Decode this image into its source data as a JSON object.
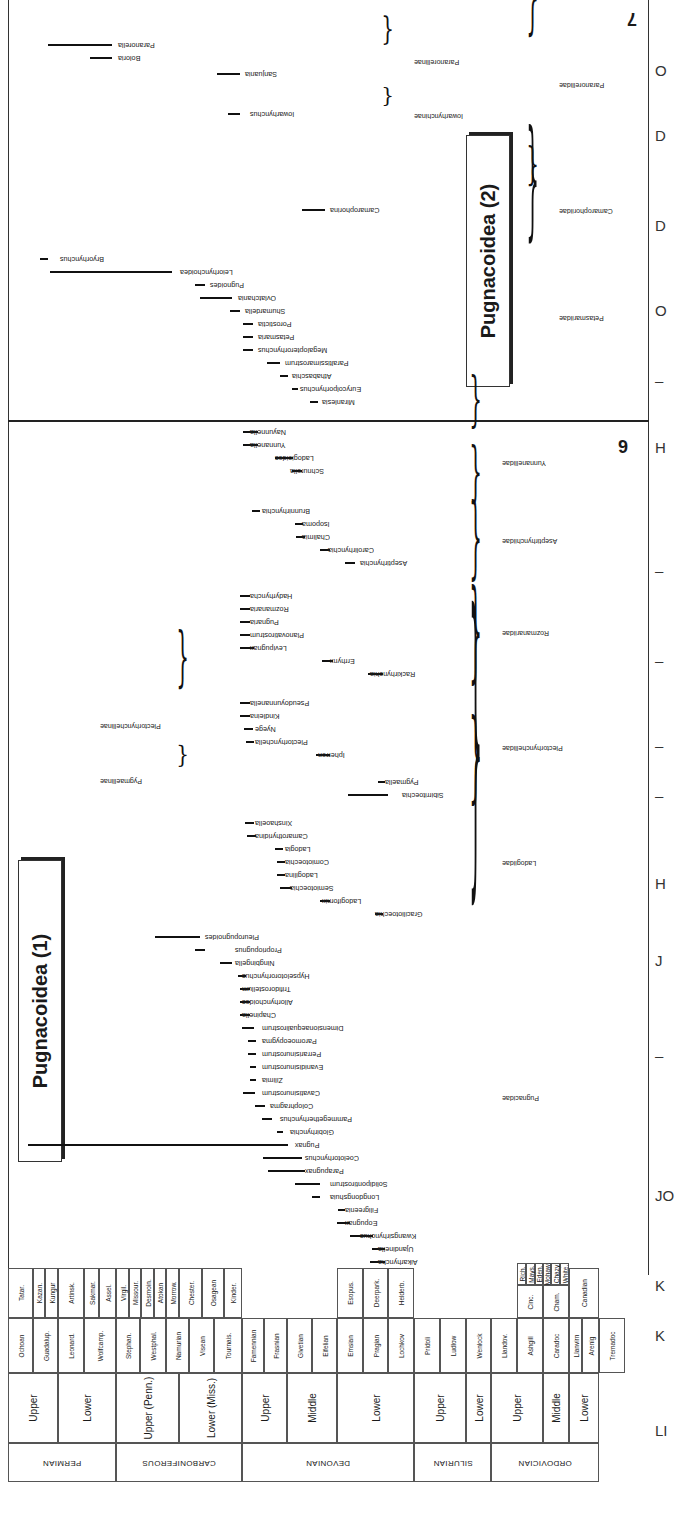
{
  "figure": {
    "orientation": "rotated-180",
    "page_numbers": {
      "left_panel": "6",
      "right_panel": "7"
    },
    "superfamily_boxes": [
      {
        "label": "Pugnacoidea (1)",
        "x": 18,
        "y": 860,
        "w": 42,
        "h": 300
      },
      {
        "label": "Pugnacoidea (2)",
        "x": 466,
        "y": 135,
        "w": 42,
        "h": 250
      }
    ],
    "right_margin_letters": [
      {
        "text": "O",
        "y": 70
      },
      {
        "text": "D",
        "y": 135
      },
      {
        "text": "D",
        "y": 225
      },
      {
        "text": "O",
        "y": 310
      },
      {
        "text": "–",
        "y": 380
      },
      {
        "text": "H",
        "y": 447
      },
      {
        "text": "–",
        "y": 570
      },
      {
        "text": "–",
        "y": 660
      },
      {
        "text": "–",
        "y": 745
      },
      {
        "text": "–",
        "y": 795
      },
      {
        "text": "H",
        "y": 883
      },
      {
        "text": "J",
        "y": 960
      },
      {
        "text": "–",
        "y": 1055
      },
      {
        "text": "JO",
        "y": 1195
      },
      {
        "text": "K",
        "y": 1285
      },
      {
        "text": "K",
        "y": 1335
      },
      {
        "text": "LI",
        "y": 1430
      }
    ]
  },
  "groups": [
    {
      "name": "Paranorellidae",
      "level": "family",
      "brace_x": 545,
      "y1": 45,
      "y2": 128
    },
    {
      "name": "Paranorellinae",
      "level": "subfamily",
      "brace_x": 400,
      "y1": 48,
      "y2": 80
    },
    {
      "name": "Iowarhynchinae",
      "level": "subfamily",
      "brace_x": 400,
      "y1": 108,
      "y2": 128
    },
    {
      "name": "Camarophoriidae",
      "level": "family",
      "brace_x": 545,
      "y1": 190,
      "y2": 235
    },
    {
      "name": "Petasmariidae",
      "level": "family",
      "brace_x": 545,
      "y1": 255,
      "y2": 385
    },
    {
      "name": "Yunnanellidae",
      "level": "family",
      "brace_x": 488,
      "y1": 435,
      "y2": 495
    },
    {
      "name": "Aseptirhynchiidae",
      "level": "family",
      "brace_x": 488,
      "y1": 510,
      "y2": 575
    },
    {
      "name": "Rozmanariidae",
      "level": "family",
      "brace_x": 488,
      "y1": 590,
      "y2": 680
    },
    {
      "name": "Plectorhynchellidae",
      "level": "family",
      "brace_x": 488,
      "y1": 695,
      "y2": 805
    },
    {
      "name": "Plectorhynchellinae",
      "level": "subfamily",
      "brace_x": 195,
      "y1": 695,
      "y2": 760
    },
    {
      "name": "Pygmaellinae",
      "level": "subfamily",
      "brace_x": 195,
      "y1": 770,
      "y2": 795
    },
    {
      "name": "Ladogiidae",
      "level": "family",
      "brace_x": 488,
      "y1": 815,
      "y2": 915
    },
    {
      "name": "Pugnacidae",
      "level": "family",
      "brace_x": 488,
      "y1": 935,
      "y2": 1265
    }
  ],
  "taxa": [
    {
      "name": "Paranorella",
      "label_x": 118,
      "y": 45,
      "bar_x1": 48,
      "bar_x2": 112
    },
    {
      "name": "Boloria",
      "label_x": 118,
      "y": 58,
      "bar_x1": 90,
      "bar_x2": 112
    },
    {
      "name": "Sanjuania",
      "label_x": 245,
      "y": 74,
      "bar_x1": 217,
      "bar_x2": 240
    },
    {
      "name": "Iowarhynchus",
      "label_x": 250,
      "y": 114,
      "bar_x1": 228,
      "bar_x2": 240
    },
    {
      "name": "Camarophorina",
      "label_x": 330,
      "y": 210,
      "bar_x1": 302,
      "bar_x2": 325
    },
    {
      "name": "Bryorhynchus",
      "label_x": 60,
      "y": 259,
      "bar_x1": 40,
      "bar_x2": 48
    },
    {
      "name": "Leiorhynchoidea",
      "label_x": 180,
      "y": 272,
      "bar_x1": 50,
      "bar_x2": 172
    },
    {
      "name": "Pugnoides",
      "label_x": 210,
      "y": 285,
      "bar_x1": 195,
      "bar_x2": 205
    },
    {
      "name": "Ovlatchania",
      "label_x": 238,
      "y": 298,
      "bar_x1": 200,
      "bar_x2": 232
    },
    {
      "name": "Shumardella",
      "label_x": 245,
      "y": 311,
      "bar_x1": 230,
      "bar_x2": 240
    },
    {
      "name": "Porostictia",
      "label_x": 258,
      "y": 324,
      "bar_x1": 243,
      "bar_x2": 253
    },
    {
      "name": "Petasmaria",
      "label_x": 258,
      "y": 337,
      "bar_x1": 243,
      "bar_x2": 253
    },
    {
      "name": "Megalopterorhynchus",
      "label_x": 258,
      "y": 350,
      "bar_x1": 243,
      "bar_x2": 253
    },
    {
      "name": "Paraltissimarostrum",
      "label_x": 285,
      "y": 363,
      "bar_x1": 267,
      "bar_x2": 280
    },
    {
      "name": "Athabaschia",
      "label_x": 292,
      "y": 376,
      "bar_x1": 280,
      "bar_x2": 288
    },
    {
      "name": "Eurycolporhynchus",
      "label_x": 300,
      "y": 389,
      "bar_x1": 292,
      "bar_x2": 298
    },
    {
      "name": "Miranlesia",
      "label_x": 322,
      "y": 402,
      "bar_x1": 310,
      "bar_x2": 318
    },
    {
      "name": "Nayunnella",
      "label_x": 250,
      "y": 432,
      "bar_x1": 243,
      "bar_x2": 258
    },
    {
      "name": "Yunnanella",
      "label_x": 250,
      "y": 445,
      "bar_x1": 243,
      "bar_x2": 258
    },
    {
      "name": "Ladogioides",
      "label_x": 275,
      "y": 458,
      "bar_x1": 275,
      "bar_x2": 293
    },
    {
      "name": "Schnurella",
      "label_x": 290,
      "y": 471,
      "bar_x1": 292,
      "bar_x2": 302
    },
    {
      "name": "Brunnirhynchia",
      "label_x": 262,
      "y": 511,
      "bar_x1": 252,
      "bar_x2": 260
    },
    {
      "name": "Isopoma",
      "label_x": 302,
      "y": 524,
      "bar_x1": 295,
      "bar_x2": 303
    },
    {
      "name": "Chalimia",
      "label_x": 302,
      "y": 537,
      "bar_x1": 296,
      "bar_x2": 305
    },
    {
      "name": "Carolirhynchia",
      "label_x": 328,
      "y": 550,
      "bar_x1": 320,
      "bar_x2": 330
    },
    {
      "name": "Aseptirhynchia",
      "label_x": 360,
      "y": 563,
      "bar_x1": 345,
      "bar_x2": 355
    },
    {
      "name": "Hadyrhyncha",
      "label_x": 250,
      "y": 596,
      "bar_x1": 240,
      "bar_x2": 250
    },
    {
      "name": "Rozmanaria",
      "label_x": 250,
      "y": 609,
      "bar_x1": 240,
      "bar_x2": 250
    },
    {
      "name": "Pugnaria",
      "label_x": 250,
      "y": 622,
      "bar_x1": 240,
      "bar_x2": 250
    },
    {
      "name": "Planovatirostrum",
      "label_x": 250,
      "y": 635,
      "bar_x1": 240,
      "bar_x2": 250
    },
    {
      "name": "Levipugnax",
      "label_x": 250,
      "y": 648,
      "bar_x1": 240,
      "bar_x2": 254
    },
    {
      "name": "Errhynx",
      "label_x": 330,
      "y": 661,
      "bar_x1": 322,
      "bar_x2": 333
    },
    {
      "name": "Rackirhynchia",
      "label_x": 370,
      "y": 674,
      "bar_x1": 368,
      "bar_x2": 383
    },
    {
      "name": "Pseudoyunnanella",
      "label_x": 250,
      "y": 703,
      "bar_x1": 240,
      "bar_x2": 250
    },
    {
      "name": "Kindleina",
      "label_x": 250,
      "y": 716,
      "bar_x1": 240,
      "bar_x2": 250
    },
    {
      "name": "Nyege",
      "label_x": 255,
      "y": 729,
      "bar_x1": 244,
      "bar_x2": 253
    },
    {
      "name": "Plectorhynchella",
      "label_x": 255,
      "y": 742,
      "bar_x1": 246,
      "bar_x2": 254
    },
    {
      "name": "Ipherron",
      "label_x": 318,
      "y": 755,
      "bar_x1": 316,
      "bar_x2": 330
    },
    {
      "name": "Pygmaella",
      "label_x": 385,
      "y": 782,
      "bar_x1": 378,
      "bar_x2": 385
    },
    {
      "name": "Sibirritoechia",
      "label_x": 402,
      "y": 795,
      "bar_x1": 348,
      "bar_x2": 388
    },
    {
      "name": "Xinshaoella",
      "label_x": 255,
      "y": 823,
      "bar_x1": 245,
      "bar_x2": 254
    },
    {
      "name": "Camarothyridina",
      "label_x": 255,
      "y": 836,
      "bar_x1": 247,
      "bar_x2": 256
    },
    {
      "name": "Ladogia",
      "label_x": 285,
      "y": 849,
      "bar_x1": 275,
      "bar_x2": 283
    },
    {
      "name": "Comiotoechia",
      "label_x": 285,
      "y": 862,
      "bar_x1": 277,
      "bar_x2": 285
    },
    {
      "name": "Ladogilina",
      "label_x": 285,
      "y": 875,
      "bar_x1": 277,
      "bar_x2": 285
    },
    {
      "name": "Semiotoechia",
      "label_x": 290,
      "y": 888,
      "bar_x1": 280,
      "bar_x2": 292
    },
    {
      "name": "Ladogifornix",
      "label_x": 322,
      "y": 901,
      "bar_x1": 320,
      "bar_x2": 330
    },
    {
      "name": "Graciliotoechia",
      "label_x": 375,
      "y": 914,
      "bar_x1": 375,
      "bar_x2": 383
    },
    {
      "name": "Pleuropugnoides",
      "label_x": 205,
      "y": 937,
      "bar_x1": 155,
      "bar_x2": 200
    },
    {
      "name": "Propriopugnus",
      "label_x": 235,
      "y": 950,
      "bar_x1": 195,
      "bar_x2": 205
    },
    {
      "name": "Ningbingella",
      "label_x": 235,
      "y": 963,
      "bar_x1": 220,
      "bar_x2": 232
    },
    {
      "name": "Hypselotororhynchus",
      "label_x": 242,
      "y": 976,
      "bar_x1": 238,
      "bar_x2": 246
    },
    {
      "name": "Trifidorostellum",
      "label_x": 242,
      "y": 989,
      "bar_x1": 240,
      "bar_x2": 250
    },
    {
      "name": "Allorhynchoides",
      "label_x": 242,
      "y": 1002,
      "bar_x1": 240,
      "bar_x2": 250
    },
    {
      "name": "Chapinella",
      "label_x": 242,
      "y": 1015,
      "bar_x1": 240,
      "bar_x2": 250
    },
    {
      "name": "Dimensionaequalirostrum",
      "label_x": 262,
      "y": 1028,
      "bar_x1": 242,
      "bar_x2": 254
    },
    {
      "name": "Paromoeopygma",
      "label_x": 262,
      "y": 1041,
      "bar_x1": 248,
      "bar_x2": 256
    },
    {
      "name": "Perrarisinurostrum",
      "label_x": 262,
      "y": 1054,
      "bar_x1": 248,
      "bar_x2": 256
    },
    {
      "name": "Evanidisinurostrum",
      "label_x": 262,
      "y": 1067,
      "bar_x1": 250,
      "bar_x2": 256
    },
    {
      "name": "Zilimia",
      "label_x": 262,
      "y": 1080,
      "bar_x1": 250,
      "bar_x2": 256
    },
    {
      "name": "Cavatisinurostrum",
      "label_x": 262,
      "y": 1093,
      "bar_x1": 243,
      "bar_x2": 255
    },
    {
      "name": "Colophragma",
      "label_x": 270,
      "y": 1106,
      "bar_x1": 255,
      "bar_x2": 265
    },
    {
      "name": "Pammegetherhynchus",
      "label_x": 280,
      "y": 1119,
      "bar_x1": 262,
      "bar_x2": 272
    },
    {
      "name": "Globirhynchia",
      "label_x": 290,
      "y": 1132,
      "bar_x1": 277,
      "bar_x2": 283
    },
    {
      "name": "Pugnax",
      "label_x": 295,
      "y": 1145,
      "bar_x1": 28,
      "bar_x2": 288
    },
    {
      "name": "Coelotorhynchus",
      "label_x": 305,
      "y": 1158,
      "bar_x1": 263,
      "bar_x2": 302
    },
    {
      "name": "Parapugnax",
      "label_x": 305,
      "y": 1171,
      "bar_x1": 268,
      "bar_x2": 305
    },
    {
      "name": "Solidipontirostrum",
      "label_x": 330,
      "y": 1184,
      "bar_x1": 295,
      "bar_x2": 320
    },
    {
      "name": "Longdongshuia",
      "label_x": 330,
      "y": 1197,
      "bar_x1": 312,
      "bar_x2": 320
    },
    {
      "name": "Filigreenia",
      "label_x": 345,
      "y": 1210,
      "bar_x1": 338,
      "bar_x2": 345
    },
    {
      "name": "Eopugnax",
      "label_x": 345,
      "y": 1223,
      "bar_x1": 337,
      "bar_x2": 350
    },
    {
      "name": "Kwangsirhynchus",
      "label_x": 360,
      "y": 1236,
      "bar_x1": 350,
      "bar_x2": 373
    },
    {
      "name": "Ujandinella",
      "label_x": 378,
      "y": 1249,
      "bar_x1": 372,
      "bar_x2": 385
    },
    {
      "name": "Aikarhyncha",
      "label_x": 378,
      "y": 1262,
      "bar_x1": 370,
      "bar_x2": 385
    }
  ],
  "stratigraphy": {
    "systems": [
      {
        "name": "PERMIAN",
        "y1": 1278,
        "y2": 1360
      },
      {
        "name": "CARBONIFEROUS",
        "y1": 1360,
        "y2": 1487
      },
      {
        "name": "DEVONIAN",
        "y1": 1487,
        "y2": 1517
      }
    ],
    "columns": [
      {
        "name": "system",
        "x1": 6,
        "x2": 44,
        "cells": [
          {
            "text": "PERMIAN",
            "y1": 1268,
            "y2": 1378
          },
          {
            "text": "CARBONIFEROUS",
            "y1": 1378,
            "y2": 1503
          },
          {
            "text": "DEVONIAN",
            "y1": 1503,
            "y2": 1517
          }
        ]
      }
    ],
    "series_cells": [
      {
        "system": "PERMIAN",
        "text": "Upper"
      },
      {
        "system": "PERMIAN",
        "text": "Lower"
      },
      {
        "system": "CARBONIFEROUS",
        "text": "Upper (Penn.)"
      },
      {
        "system": "CARBONIFEROUS",
        "text": "Lower (Miss.)"
      },
      {
        "system": "DEVONIAN",
        "text": "Upper"
      },
      {
        "system": "DEVONIAN",
        "text": "Middle"
      },
      {
        "system": "DEVONIAN",
        "text": "Lower"
      },
      {
        "system": "SILURIAN",
        "text": "Upper"
      },
      {
        "system": "SILURIAN",
        "text": "Lower"
      },
      {
        "system": "ORDOVICIAN",
        "text": "Upper"
      },
      {
        "system": "ORDOVICIAN",
        "text": "Middle"
      },
      {
        "system": "ORDOVICIAN",
        "text": "Lower"
      }
    ],
    "stage_cells": [
      "Ochoan",
      "Guadalup.",
      "Leonard.",
      "Wolfcamp.",
      "Stephan.",
      "Westphal.",
      "Namurian",
      "Visean",
      "Tournais.",
      "Famennian",
      "Frasnian",
      "Givetian",
      "Eifelian",
      "Emsian",
      "Pragian",
      "Lochkov",
      "Pridoli",
      "Ludlow",
      "Wenlock",
      "Llandov.",
      "Ashgill",
      "Caradoc",
      "Llanvirn",
      "Arenig",
      "Tremadoc"
    ],
    "substage_cells": [
      "Tatar.",
      "Kazan.",
      "Kungur",
      "Artinsk.",
      "Sakmar.",
      "Assel.",
      "Virgil.",
      "Missour.",
      "Desmoin.",
      "Atokan",
      "Morrow.",
      "Chester.",
      "Osagean",
      "Kinder.",
      "Esopus.",
      "Deerpark.",
      "Helderb.",
      "Rich.",
      "Mays.",
      "Eden.",
      "Mohaw.",
      "Chazy",
      "White.",
      "Cinc.",
      "Cham.",
      "Canadian"
    ]
  }
}
